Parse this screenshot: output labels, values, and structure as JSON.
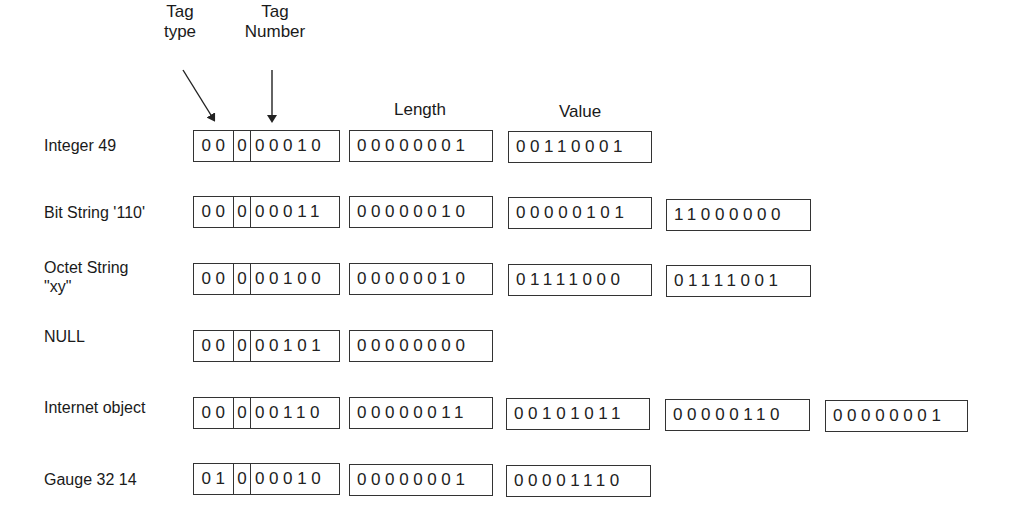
{
  "headers": {
    "tag_type": [
      "Tag",
      "type"
    ],
    "tag_number": [
      "Tag",
      "Number"
    ],
    "length": "Length",
    "value": "Value"
  },
  "rows": [
    {
      "label": [
        "Integer 49"
      ],
      "tag": [
        "00",
        "0",
        "00010"
      ],
      "length": "00000001",
      "values": [
        "00110001"
      ]
    },
    {
      "label": [
        "Bit String '110'"
      ],
      "tag": [
        "00",
        "0",
        "00011"
      ],
      "length": "00000010",
      "values": [
        "00000101",
        "11000000"
      ]
    },
    {
      "label": [
        "Octet String",
        "\"xy\""
      ],
      "tag": [
        "00",
        "0",
        "00100"
      ],
      "length": "00000010",
      "values": [
        "01111000",
        "01111001"
      ]
    },
    {
      "label": [
        "NULL"
      ],
      "tag": [
        "00",
        "0",
        "00101"
      ],
      "length": "00000000",
      "values": []
    },
    {
      "label": [
        "Internet object"
      ],
      "tag": [
        "00",
        "0",
        "00110"
      ],
      "length": "00000011",
      "values": [
        "00101011",
        "00000110",
        "00000001"
      ]
    },
    {
      "label": [
        "Gauge 32 14"
      ],
      "tag": [
        "01",
        "0",
        "00010"
      ],
      "length": "00000001",
      "values": [
        "00001110"
      ]
    }
  ]
}
